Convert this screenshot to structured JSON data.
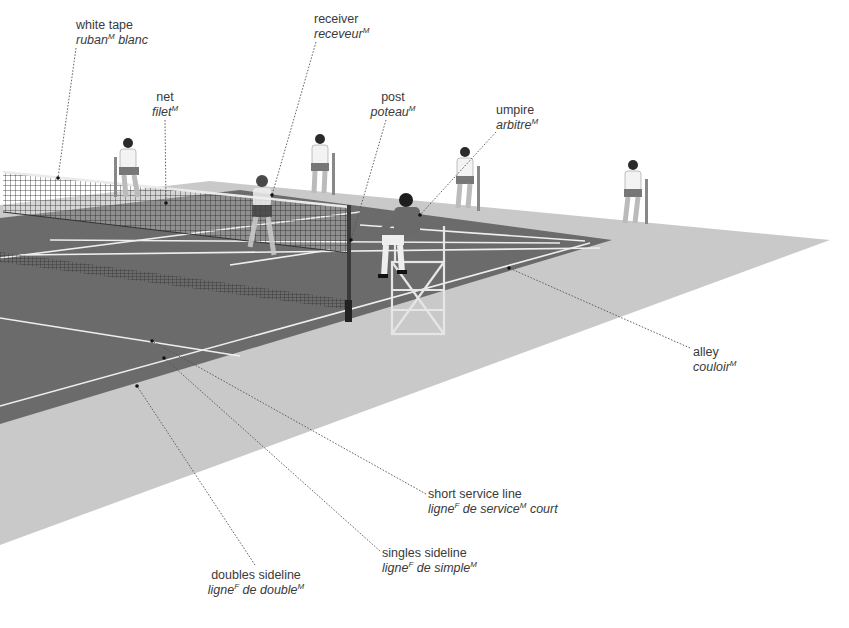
{
  "colors": {
    "background": "#ffffff",
    "surround": "#c9c9c9",
    "court": "#6b6b6b",
    "lines": "#f2f2f2",
    "text": "#3a3a3a",
    "leader": "#555555"
  },
  "labels": [
    {
      "id": "white-tape",
      "en": "white tape",
      "fr": "ruban",
      "gender": "M",
      "fr_suffix": " blanc",
      "x": 76,
      "y": 18,
      "align": "left"
    },
    {
      "id": "net",
      "en": "net",
      "fr": "filet",
      "gender": "M",
      "fr_suffix": "",
      "x": 138,
      "y": 90,
      "align": "center"
    },
    {
      "id": "receiver",
      "en": "receiver",
      "fr": "receveur",
      "gender": "M",
      "fr_suffix": "",
      "x": 314,
      "y": 12,
      "align": "left"
    },
    {
      "id": "post",
      "en": "post",
      "fr": "poteau",
      "gender": "M",
      "fr_suffix": "",
      "x": 368,
      "y": 90,
      "align": "center"
    },
    {
      "id": "umpire",
      "en": "umpire",
      "fr": "arbitre",
      "gender": "M",
      "fr_suffix": "",
      "x": 496,
      "y": 103,
      "align": "left"
    },
    {
      "id": "alley",
      "en": "alley",
      "fr": "couloir",
      "gender": "M",
      "fr_suffix": "",
      "x": 693,
      "y": 345,
      "align": "left"
    },
    {
      "id": "short-service-line",
      "en": "short service line",
      "fr_parts": [
        {
          "t": "ligne",
          "g": "F"
        },
        {
          "t": " de service",
          "g": "M"
        },
        {
          "t": " court",
          "g": ""
        }
      ],
      "x": 428,
      "y": 487,
      "align": "left"
    },
    {
      "id": "singles-sideline",
      "en": "singles sideline",
      "fr_parts": [
        {
          "t": "ligne",
          "g": "F"
        },
        {
          "t": " de simple",
          "g": "M"
        }
      ],
      "x": 382,
      "y": 546,
      "align": "left"
    },
    {
      "id": "doubles-sideline",
      "en": "doubles sideline",
      "fr_parts": [
        {
          "t": "ligne",
          "g": "F"
        },
        {
          "t": " de double",
          "g": "M"
        }
      ],
      "x": 206,
      "y": 568,
      "align": "center"
    }
  ],
  "leaders": [
    {
      "for": "white-tape",
      "x1": 76,
      "y1": 48,
      "x2": 58,
      "y2": 178
    },
    {
      "for": "net",
      "x1": 165,
      "y1": 120,
      "x2": 166,
      "y2": 203
    },
    {
      "for": "receiver",
      "x1": 316,
      "y1": 42,
      "x2": 272,
      "y2": 195
    },
    {
      "for": "post",
      "x1": 386,
      "y1": 120,
      "x2": 351,
      "y2": 240
    },
    {
      "for": "umpire",
      "x1": 496,
      "y1": 132,
      "x2": 420,
      "y2": 215
    },
    {
      "for": "alley",
      "x1": 690,
      "y1": 348,
      "x2": 509,
      "y2": 268
    },
    {
      "for": "short-service-line",
      "x1": 426,
      "y1": 494,
      "x2": 152,
      "y2": 341
    },
    {
      "for": "singles-sideline",
      "x1": 380,
      "y1": 551,
      "x2": 164,
      "y2": 358
    },
    {
      "for": "doubles-sideline",
      "x1": 255,
      "y1": 565,
      "x2": 137,
      "y2": 386
    }
  ],
  "scene": {
    "people": [
      {
        "role": "spectator",
        "x": 130,
        "y": 168
      },
      {
        "role": "receiver",
        "x": 262,
        "y": 210
      },
      {
        "role": "spectator",
        "x": 320,
        "y": 162
      },
      {
        "role": "umpire",
        "x": 406,
        "y": 222
      },
      {
        "role": "spectator",
        "x": 466,
        "y": 178
      },
      {
        "role": "spectator",
        "x": 632,
        "y": 190
      }
    ]
  }
}
